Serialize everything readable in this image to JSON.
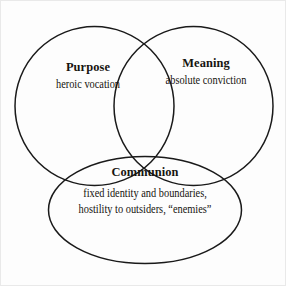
{
  "diagram": {
    "type": "venn-3-set",
    "background_color": "#fdfdfd",
    "stroke_color": "#1a1a1a",
    "text_color": "#16140f",
    "border_color": "#e9e9e9",
    "sets": [
      {
        "id": "purpose",
        "shape": "circle",
        "title": "Purpose",
        "description": "heroic vocation"
      },
      {
        "id": "meaning",
        "shape": "circle",
        "title": "Meaning",
        "description": "absolute conviction"
      },
      {
        "id": "communion",
        "shape": "ellipse",
        "title": "Communion",
        "description_line_1": "fixed identity and boundaries,",
        "description_line_2": "hostility to outsiders, “enemies”"
      }
    ]
  }
}
